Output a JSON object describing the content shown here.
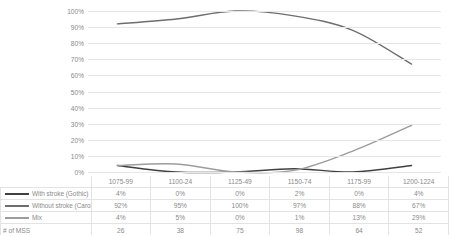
{
  "chart_data": {
    "type": "line",
    "title": "",
    "xlabel": "",
    "ylabel": "",
    "ylim": [
      0,
      100
    ],
    "ytick_labels": [
      "100%",
      "90%",
      "80%",
      "70%",
      "60%",
      "50%",
      "40%",
      "30%",
      "20%",
      "10%",
      "0%"
    ],
    "ytick_values": [
      100,
      90,
      80,
      70,
      60,
      50,
      40,
      30,
      20,
      10,
      0
    ],
    "grid": true,
    "legend_position": "table-left",
    "categories": [
      "1075-99",
      "1100-24",
      "1125-49",
      "1150-74",
      "1175-99",
      "1200-1224"
    ],
    "series": [
      {
        "name": "With stroke (Gothic)",
        "color": "#404040",
        "values": [
          4,
          0,
          0,
          2,
          0,
          4
        ],
        "labels": [
          "4%",
          "0%",
          "0%",
          "2%",
          "0%",
          "4%"
        ]
      },
      {
        "name": "Without stroke (Caroline)",
        "color": "#6e6e6e",
        "values": [
          92,
          95,
          100,
          97,
          88,
          67
        ],
        "labels": [
          "92%",
          "95%",
          "100%",
          "97%",
          "88%",
          "67%"
        ]
      },
      {
        "name": "Mix",
        "color": "#9c9c9c",
        "values": [
          4,
          5,
          0,
          1,
          13,
          29
        ],
        "labels": [
          "4%",
          "5%",
          "0%",
          "1%",
          "13%",
          "29%"
        ]
      }
    ],
    "count_row": {
      "name": "# of MSS",
      "values": [
        26,
        38,
        75,
        98,
        64,
        52
      ],
      "labels": [
        "26",
        "38",
        "75",
        "98",
        "64",
        "52"
      ]
    }
  }
}
